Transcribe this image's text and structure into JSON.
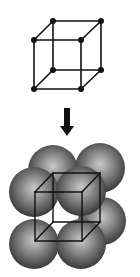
{
  "diagram": {
    "colors": {
      "background": "#ffffff",
      "line": "#111111",
      "sphere_light": "#c8c8c8",
      "sphere_mid": "#808080",
      "sphere_dark": "#3a3a3a"
    },
    "lattice_cube": {
      "vertices": [
        {
          "id": "ftl",
          "x": 34,
          "y": 40
        },
        {
          "id": "ftr",
          "x": 81,
          "y": 40
        },
        {
          "id": "fbl",
          "x": 34,
          "y": 89
        },
        {
          "id": "fbr",
          "x": 81,
          "y": 89
        },
        {
          "id": "btl",
          "x": 53,
          "y": 21
        },
        {
          "id": "btr",
          "x": 101,
          "y": 21
        },
        {
          "id": "bbl",
          "x": 53,
          "y": 70
        },
        {
          "id": "bbr",
          "x": 101,
          "y": 70
        }
      ],
      "point_radius": 3
    },
    "arrow": {
      "direction": "down",
      "x": 67,
      "y_start": 108,
      "y_end": 136
    },
    "sphere_cube": {
      "spheres": [
        {
          "id": "back-top-left",
          "cx": 53,
          "cy": 170,
          "r": 25
        },
        {
          "id": "back-top-right",
          "cx": 100,
          "cy": 168,
          "r": 25
        },
        {
          "id": "back-bottom-right",
          "cx": 102,
          "cy": 221,
          "r": 24
        },
        {
          "id": "front-top-left",
          "cx": 34,
          "cy": 192,
          "r": 25
        },
        {
          "id": "front-bottom-left",
          "cx": 34,
          "cy": 244,
          "r": 25
        },
        {
          "id": "front-bottom-right",
          "cx": 81,
          "cy": 244,
          "r": 25
        },
        {
          "id": "front-top-right",
          "cx": 81,
          "cy": 191,
          "r": 25
        }
      ],
      "vertices": [
        {
          "id": "ftl",
          "x": 35,
          "y": 192
        },
        {
          "id": "ftr",
          "x": 82,
          "y": 192
        },
        {
          "id": "fbl",
          "x": 35,
          "y": 241
        },
        {
          "id": "fbr",
          "x": 82,
          "y": 241
        },
        {
          "id": "btl",
          "x": 53,
          "y": 173
        },
        {
          "id": "btr",
          "x": 100,
          "y": 173
        },
        {
          "id": "bbl",
          "x": 53,
          "y": 222
        },
        {
          "id": "bbr",
          "x": 100,
          "y": 222
        }
      ]
    }
  }
}
